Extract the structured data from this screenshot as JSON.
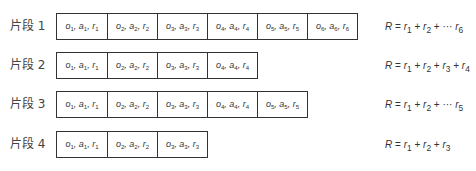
{
  "episodes": [
    {
      "label": "片段 1",
      "steps": [
        "o1, a1, r1",
        "o2, a2, r2",
        "o3, a3, r3",
        "o4, a4, r4",
        "o5, a5, r5",
        "o6, a6, r6"
      ],
      "return_formula": "R = r1 + r2 + ··· r6"
    },
    {
      "label": "片段 2",
      "steps": [
        "o1, a1, r1",
        "o2, a2, r2",
        "o3, a3, r3",
        "o4, a4, r4"
      ],
      "return_formula": "R = r1 + r2 + r3 + r4"
    },
    {
      "label": "片段 3",
      "steps": [
        "o1, a1, r1",
        "o2, a2, r2",
        "o3, a3, r3",
        "o4, a4, r4",
        "o5, a5, r5"
      ],
      "return_formula": "R = r1 + r2 + ··· r5"
    },
    {
      "label": "片段 4",
      "steps": [
        "o1, a1, r1",
        "o2, a2, r2",
        "o3, a3, r3"
      ],
      "return_formula": "R = r1 + r2 + r3"
    }
  ]
}
